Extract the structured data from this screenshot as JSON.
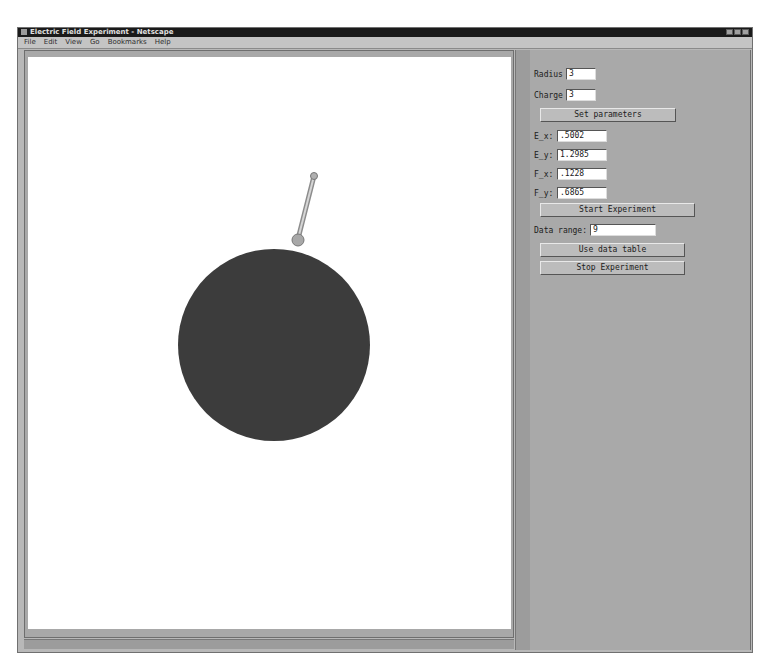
{
  "window": {
    "title": "Electric Field Experiment - Netscape",
    "controls": [
      "minimize",
      "maximize",
      "close"
    ]
  },
  "menu": [
    "File",
    "Edit",
    "View",
    "Go",
    "Bookmarks",
    "Help"
  ],
  "canvas": {
    "sphere": {
      "cx": 246,
      "cy": 288,
      "r": 96,
      "color": "#3c3c3c"
    },
    "probe": {
      "base_x": 270,
      "base_y": 182,
      "tip_x": 286,
      "tip_y": 119,
      "color": "#a8a8a8"
    }
  },
  "panel": {
    "radius_label": "Radius",
    "radius_value": "3",
    "charge_label": "Charge",
    "charge_value": "3",
    "set_params_button": "Set parameters",
    "readouts": [
      {
        "label": "E_x:",
        "value": ".5002"
      },
      {
        "label": "E_y:",
        "value": "1.2985"
      },
      {
        "label": "F_x:",
        "value": ".1228"
      },
      {
        "label": "F_y:",
        "value": ".6865"
      }
    ],
    "start_button": "Start Experiment",
    "data_range_label": "Data range:",
    "data_range_value": "9",
    "use_table_button": "Use data table",
    "stop_button": "Stop Experiment"
  }
}
